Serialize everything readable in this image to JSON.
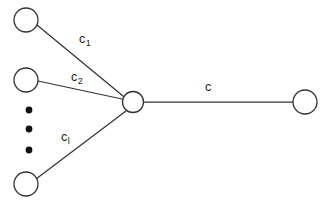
{
  "figure": {
    "background_color": "#ffffff",
    "stroke_color": "#333333",
    "dot_color": "#111111",
    "label_color": "#1a1a1a",
    "width": 327,
    "height": 203
  },
  "nodes": [
    {
      "id": "leaf-1",
      "name": "source-node-1",
      "cx": 26,
      "cy": 20,
      "r": 12,
      "fill": "#ffffff"
    },
    {
      "id": "leaf-2",
      "name": "source-node-2",
      "cx": 26,
      "cy": 80,
      "r": 12,
      "fill": "#ffffff"
    },
    {
      "id": "leaf-l",
      "name": "source-node-l",
      "cx": 26,
      "cy": 184,
      "r": 12,
      "fill": "#ffffff"
    },
    {
      "id": "hub",
      "name": "relay-node",
      "cx": 133,
      "cy": 102,
      "r": 10.5,
      "fill": "#ffffff"
    },
    {
      "id": "sink",
      "name": "destination-node",
      "cx": 305,
      "cy": 102,
      "r": 12,
      "fill": "#ffffff"
    }
  ],
  "edges": [
    {
      "id": "e1",
      "name": "edge-leaf1-hub",
      "from": "leaf-1",
      "to": "hub",
      "x1": 37,
      "y1": 25,
      "x2": 123,
      "y2": 96
    },
    {
      "id": "e2",
      "name": "edge-leaf2-hub",
      "from": "leaf-2",
      "to": "hub",
      "x1": 38,
      "y1": 81,
      "x2": 122,
      "y2": 99
    },
    {
      "id": "e3",
      "name": "edge-leafl-hub",
      "from": "leaf-l",
      "to": "hub",
      "x1": 36,
      "y1": 179,
      "x2": 126,
      "y2": 111
    },
    {
      "id": "e4",
      "name": "edge-hub-sink",
      "from": "hub",
      "to": "sink",
      "x1": 144,
      "y1": 102,
      "x2": 293,
      "y2": 102
    }
  ],
  "edge_labels": [
    {
      "id": "lbl-c1",
      "name": "edge-label-c1",
      "base": "c",
      "subscript": "1",
      "x": 79,
      "y": 33
    },
    {
      "id": "lbl-c2",
      "name": "edge-label-c2",
      "base": "c",
      "subscript": "2",
      "x": 71,
      "y": 71
    },
    {
      "id": "lbl-cl",
      "name": "edge-label-cl",
      "base": "c",
      "subscript": "l",
      "x": 61,
      "y": 131
    },
    {
      "id": "lbl-c",
      "name": "edge-label-c",
      "base": "c",
      "subscript": "",
      "x": 205,
      "y": 81
    }
  ],
  "ellipsis_dots": [
    {
      "id": "dot-1",
      "name": "vertical-ellipsis-dot",
      "cx": 29,
      "cy": 110,
      "r": 3.4
    },
    {
      "id": "dot-2",
      "name": "vertical-ellipsis-dot",
      "cx": 29,
      "cy": 129,
      "r": 3.4
    },
    {
      "id": "dot-3",
      "name": "vertical-ellipsis-dot",
      "cx": 29,
      "cy": 150,
      "r": 3.4
    }
  ],
  "chart_data": {
    "type": "diagram",
    "diagram_kind": "node-link-graph",
    "node_count": 5,
    "edge_count": 4,
    "edge_capacities": [
      "c_1",
      "c_2",
      "c_l",
      "c"
    ],
    "ellipsis_indicates": "additional source nodes omitted between node 2 and node l"
  }
}
